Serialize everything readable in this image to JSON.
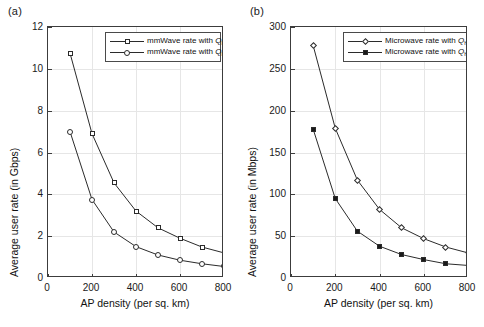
{
  "figure": {
    "panels": [
      {
        "tag": "(a)",
        "xlabel": "AP density (per sq. km)",
        "ylabel": "Average user rate (in Gbps)",
        "legend": [
          {
            "prefix": "mmWave rate with ",
            "symbol": "Q",
            "sub": "h",
            "eq": " = 20",
            "marker": "open-square"
          },
          {
            "prefix": "mmWave rate with ",
            "symbol": "Q",
            "sub": "h",
            "eq": " = 10",
            "marker": "open-circle"
          }
        ],
        "xticks": [
          "0",
          "200",
          "400",
          "600",
          "800"
        ],
        "yticks": [
          "0",
          "2",
          "4",
          "6",
          "8",
          "10",
          "12"
        ]
      },
      {
        "tag": "(b)",
        "xlabel": "AP density (per sq. km)",
        "ylabel": "Average user rate (in Mbps)",
        "legend": [
          {
            "prefix": "Microwave rate with ",
            "symbol": "Q",
            "sub": "h",
            "eq": " = 20",
            "marker": "open-diamond"
          },
          {
            "prefix": "Microwave rate with ",
            "symbol": "Q",
            "sub": "h",
            "eq": " = 10",
            "marker": "filled-square"
          }
        ],
        "xticks": [
          "0",
          "200",
          "400",
          "600",
          "800"
        ],
        "yticks": [
          "0",
          "50",
          "100",
          "150",
          "200",
          "250",
          "300"
        ]
      }
    ]
  },
  "chart_data": [
    {
      "type": "line",
      "panel": "(a)",
      "title": "",
      "xlabel": "AP density (per sq. km)",
      "ylabel": "Average user rate (in Gbps)",
      "xlim": [
        0,
        800
      ],
      "ylim": [
        0,
        12
      ],
      "xticks": [
        0,
        200,
        400,
        600,
        800
      ],
      "yticks": [
        0,
        2,
        4,
        6,
        8,
        10,
        12
      ],
      "grid": true,
      "legend_position": "upper-right",
      "x": [
        100,
        200,
        300,
        400,
        500,
        600,
        700,
        800
      ],
      "series": [
        {
          "name": "mmWave rate with Q_h = 20",
          "marker": "open-square",
          "values": [
            10.75,
            6.9,
            4.55,
            3.2,
            2.4,
            1.9,
            1.48,
            1.2
          ]
        },
        {
          "name": "mmWave rate with Q_h = 10",
          "marker": "open-circle",
          "values": [
            7.0,
            3.75,
            2.2,
            1.5,
            1.1,
            0.85,
            0.68,
            0.55
          ]
        }
      ]
    },
    {
      "type": "line",
      "panel": "(b)",
      "title": "",
      "xlabel": "AP density (per sq. km)",
      "ylabel": "Average user rate (in Mbps)",
      "xlim": [
        0,
        800
      ],
      "ylim": [
        0,
        300
      ],
      "xticks": [
        0,
        200,
        400,
        600,
        800
      ],
      "yticks": [
        0,
        50,
        100,
        150,
        200,
        250,
        300
      ],
      "grid": true,
      "legend_position": "upper-right",
      "x": [
        100,
        200,
        300,
        400,
        500,
        600,
        700,
        800
      ],
      "series": [
        {
          "name": "Microwave rate with Q_h = 20",
          "marker": "open-diamond",
          "values": [
            278,
            179,
            117,
            82,
            60,
            47,
            37,
            30
          ]
        },
        {
          "name": "Microwave rate with Q_h = 10",
          "marker": "filled-square",
          "values": [
            178,
            95,
            56,
            38,
            28,
            22,
            17,
            15
          ]
        }
      ]
    }
  ],
  "colors": {
    "line": "#2b2b2b",
    "axis": "#3c3c3c",
    "grid": "#e6e6e6",
    "text": "#111111",
    "background": "#ffffff"
  }
}
